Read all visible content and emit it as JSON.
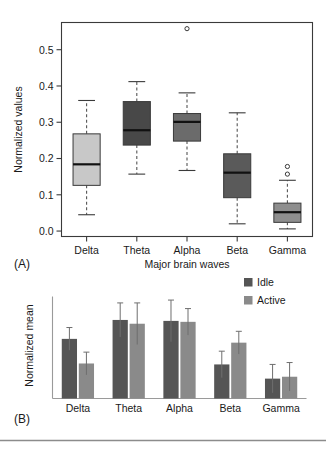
{
  "figure": {
    "bottom_rule_color": "#8c8c8c"
  },
  "panelA": {
    "label": "(A)",
    "ylabel": "Normalized values",
    "xlabel": "Major brain waves"
  },
  "panelB": {
    "label": "(B)",
    "ylabel": "Normalized mean"
  },
  "legend": {
    "items": [
      {
        "label": "Idle",
        "color": "#555555"
      },
      {
        "label": "Active",
        "color": "#8a8a8a"
      }
    ]
  },
  "chart_data": [
    {
      "type": "box",
      "panel": "A",
      "title": "",
      "xlabel": "Major brain waves",
      "ylabel": "Normalized values",
      "categories": [
        "Delta",
        "Theta",
        "Alpha",
        "Beta",
        "Gamma"
      ],
      "yticks": [
        0.0,
        0.1,
        0.2,
        0.3,
        0.4,
        0.5
      ],
      "yticklabels": [
        "0.0",
        "0.1",
        "0.2",
        "0.3",
        "0.4",
        "0.5"
      ],
      "ylim": [
        -0.015,
        0.575
      ],
      "grid": false,
      "boxes": [
        {
          "category": "Delta",
          "whisker_low": 0.045,
          "q1": 0.126,
          "median": 0.184,
          "q3": 0.268,
          "whisker_high": 0.36,
          "outliers": [],
          "fill": "#c8c8c8"
        },
        {
          "category": "Theta",
          "whisker_low": 0.157,
          "q1": 0.237,
          "median": 0.278,
          "q3": 0.357,
          "whisker_high": 0.412,
          "outliers": [],
          "fill": "#484848"
        },
        {
          "category": "Alpha",
          "whisker_low": 0.167,
          "q1": 0.248,
          "median": 0.301,
          "q3": 0.324,
          "whisker_high": 0.381,
          "outliers": [
            0.558
          ],
          "fill": "#6b6b6b"
        },
        {
          "category": "Beta",
          "whisker_low": 0.02,
          "q1": 0.092,
          "median": 0.161,
          "q3": 0.213,
          "whisker_high": 0.326,
          "outliers": [],
          "fill": "#5a5a5a"
        },
        {
          "category": "Gamma",
          "whisker_low": 0.006,
          "q1": 0.024,
          "median": 0.052,
          "q3": 0.077,
          "whisker_high": 0.14,
          "outliers": [
            0.157,
            0.178
          ],
          "fill": "#8e8e8e"
        }
      ]
    },
    {
      "type": "bar",
      "panel": "B",
      "title": "",
      "xlabel": "",
      "ylabel": "Normalized mean",
      "categories": [
        "Delta",
        "Theta",
        "Alpha",
        "Beta",
        "Gamma"
      ],
      "ylim": [
        0,
        1.12
      ],
      "grid": false,
      "legend_position": "top-right",
      "series": [
        {
          "name": "Idle",
          "color": "#555555",
          "values": [
            0.63,
            0.83,
            0.82,
            0.36,
            0.21
          ],
          "errors": [
            0.12,
            0.18,
            0.22,
            0.14,
            0.15
          ]
        },
        {
          "name": "Active",
          "color": "#8a8a8a",
          "values": [
            0.37,
            0.79,
            0.81,
            0.59,
            0.23
          ],
          "errors": [
            0.12,
            0.22,
            0.14,
            0.12,
            0.15
          ]
        }
      ]
    }
  ]
}
